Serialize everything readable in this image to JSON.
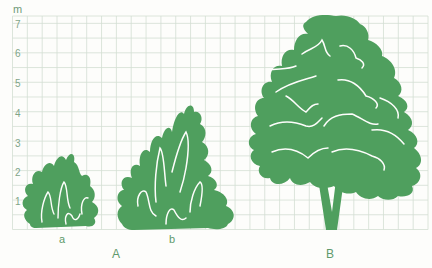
{
  "figure": {
    "unit_label": "m",
    "y_ticks": [
      "7",
      "6",
      "5",
      "4",
      "3",
      "2",
      "1"
    ],
    "plants": [
      {
        "id": "a",
        "label": "a",
        "group": "A",
        "kind": "small shrub",
        "height_m": 2.6
      },
      {
        "id": "b",
        "label": "b",
        "group": "A",
        "kind": "larger shrub",
        "height_m": 4.2
      },
      {
        "id": "B",
        "label": "B",
        "group": "B",
        "kind": "tree",
        "height_m": 7.3
      }
    ],
    "group_labels": [
      "A",
      "B"
    ],
    "colors": {
      "foliage": "#4f9f5e",
      "grid": "#cfdccf",
      "label": "#5f9a6c",
      "background": "#fdfdfb"
    }
  }
}
